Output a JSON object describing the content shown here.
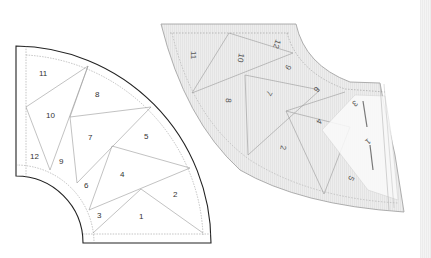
{
  "colors": {
    "outline": "#222222",
    "seam": "#888888",
    "dashed": "#777777",
    "right_piece_fill": "#ececec",
    "sheet_overlay": "#fafafa",
    "background": "#ffffff"
  },
  "left_pattern": {
    "label": "numbered foundation pattern",
    "section_numbers": [
      "1",
      "2",
      "3",
      "4",
      "5",
      "6",
      "7",
      "8",
      "9",
      "10",
      "11",
      "12"
    ]
  },
  "right_pattern": {
    "label": "foundation paper with fabric, reverse side",
    "section_numbers": [
      "11",
      "10",
      "12",
      "9",
      "8",
      "7",
      "6",
      "4",
      "2",
      "3",
      "5",
      "1"
    ]
  }
}
